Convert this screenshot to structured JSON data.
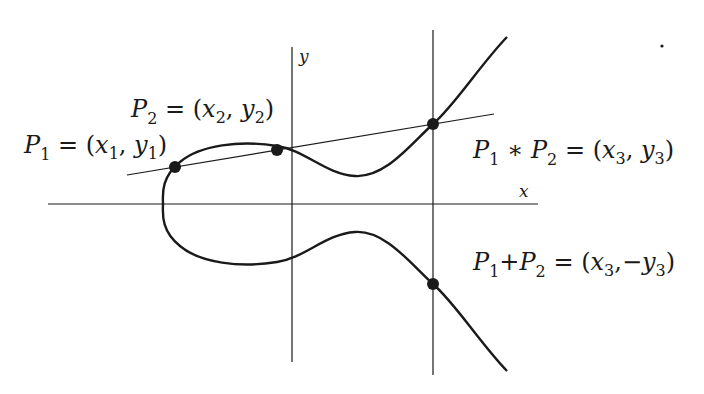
{
  "diagram": {
    "colors": {
      "stroke": "#1a1a1a",
      "background": "#ffffff"
    },
    "axes": {
      "x_label": "x",
      "y_label": "y"
    },
    "points": [
      {
        "id": "P1",
        "label": "P1 = (x1, y1)",
        "cx": 175,
        "cy": 167
      },
      {
        "id": "P2",
        "label": "P2 = (x2, y2)",
        "cx": 277,
        "cy": 150
      },
      {
        "id": "P1*P2",
        "label": "P1 * P2 = (x3, y3)",
        "cx": 433,
        "cy": 124
      },
      {
        "id": "P1+P2",
        "label": "P1+P2 = (x3, -y3)",
        "cx": 433,
        "cy": 284
      }
    ],
    "labels": {
      "p1": {
        "P": "P",
        "sub": "1",
        "rest_eq": " = (",
        "x": "x",
        "xsub": "1",
        "comma": ", ",
        "y": "y",
        "ysub": "1",
        "close": ")"
      },
      "p2": {
        "P": "P",
        "sub": "2",
        "rest_eq": " = (",
        "x": "x",
        "xsub": "2",
        "comma": ", ",
        "y": "y",
        "ysub": "2",
        "close": ")"
      },
      "p3": {
        "P1": "P",
        "sub1": "1",
        "op": " ∗ ",
        "P2": "P",
        "sub2": "2",
        "rest_eq": " = (",
        "x": "x",
        "xsub": "3",
        "comma": ", ",
        "y": "y",
        "ysub": "3",
        "close": ")"
      },
      "p4": {
        "P1": "P",
        "sub1": "1",
        "op": "+",
        "P2": "P",
        "sub2": "2",
        "rest_eq": " = (",
        "x": "x",
        "xsub": "3",
        "comma": ",−",
        "y": "y",
        "ysub": "3",
        "close": ")"
      }
    }
  }
}
